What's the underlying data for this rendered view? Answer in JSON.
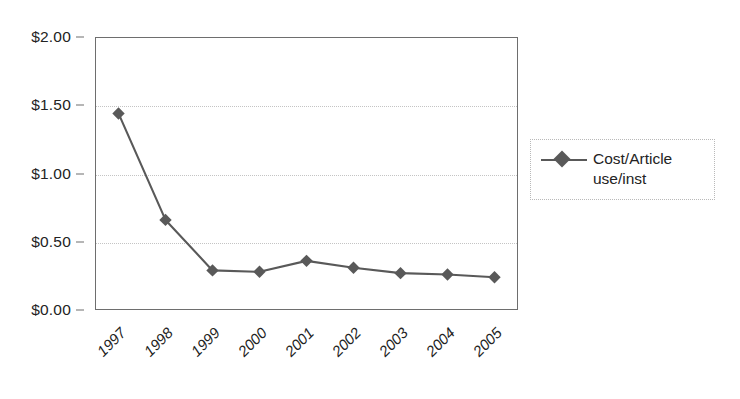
{
  "chart_data": {
    "type": "line",
    "title": "",
    "xlabel": "",
    "ylabel": "",
    "categories": [
      "1997",
      "1998",
      "1999",
      "2000",
      "2001",
      "2002",
      "2003",
      "2004",
      "2005"
    ],
    "series": [
      {
        "name": "Cost/Article use/inst",
        "values": [
          1.44,
          0.66,
          0.29,
          0.28,
          0.36,
          0.31,
          0.27,
          0.26,
          0.24
        ],
        "marker": "diamond",
        "color": "#595959"
      }
    ],
    "ylim": [
      0,
      2.0
    ],
    "ytick_values": [
      2.0,
      1.5,
      1.0,
      0.5,
      0.0
    ],
    "ytick_labels": [
      "$2.00",
      "$1.50",
      "$1.00",
      "$0.50",
      "$0.00"
    ],
    "grid": true,
    "grid_axis": "y",
    "legend_position": "right",
    "legend_entries": [
      "Cost/Article\nuse/inst"
    ],
    "xtick_rotation": -45
  },
  "legend": {
    "entry_label": "Cost/Article\nuse/inst"
  },
  "colors": {
    "series": "#595959",
    "frame": "#6e6e6e",
    "grid": "#c4c4c4",
    "text": "#232323",
    "background": "#ffffff"
  }
}
